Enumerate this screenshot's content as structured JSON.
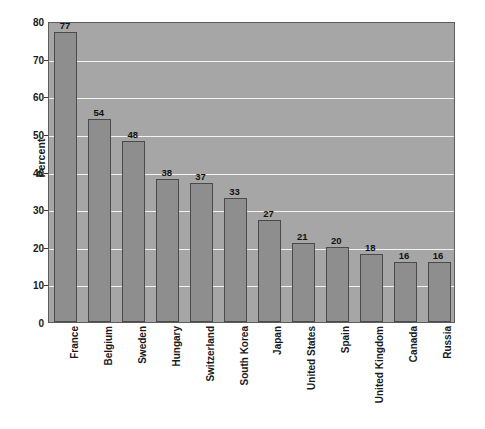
{
  "chart_data": {
    "type": "bar",
    "title": "",
    "subtitle": "",
    "xlabel": "",
    "ylabel": "Percent",
    "ylim": [
      0,
      80
    ],
    "ytick_step": 10,
    "yticks": [
      0,
      10,
      20,
      30,
      40,
      50,
      60,
      70,
      80
    ],
    "grid": true,
    "gridlines": "horizontal",
    "legend": "none",
    "orientation": "vertical",
    "xtick_rotation": -90,
    "show_value_labels": true,
    "categories": [
      "France",
      "Belgium",
      "Sweden",
      "Hungary",
      "Switzerland",
      "South Korea",
      "Japan",
      "United States",
      "Spain",
      "United Kingdom",
      "Canada",
      "Russia"
    ],
    "values": [
      77,
      54,
      48,
      38,
      37,
      33,
      27,
      21,
      20,
      18,
      16,
      16
    ],
    "value_labels": [
      "77",
      "54",
      "48",
      "38",
      "37",
      "33",
      "27",
      "21",
      "20",
      "18",
      "16",
      "16"
    ],
    "ytick_labels": [
      "0",
      "10",
      "20",
      "30",
      "40",
      "50",
      "60",
      "70",
      "80"
    ]
  },
  "colors": {
    "plot_background": "#a6a6a6",
    "bar_fill": "#8e8e8e",
    "bar_border": "#4a4a4a",
    "gridline": "#f2f2f2",
    "frame": "#5d5d5d",
    "text": "#1a1a1a",
    "page_background": "#ffffff"
  }
}
